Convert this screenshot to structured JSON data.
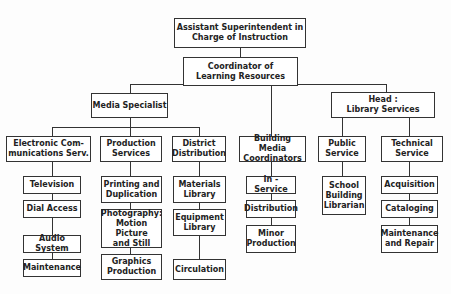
{
  "chart": {
    "root": "Assistant Superintendent in\nCharge of Instruction",
    "coordinator": "Coordinator of\nLearning Resources",
    "media_specialist": "Media Specialist",
    "head_library": "Head :\nLibrary Services",
    "electronic": "Electronic Com-\nmunications Serv.",
    "production": "Production\nServices",
    "district": "District\nDistribution",
    "building": "Building Media\nCoordinators",
    "public": "Public\nService",
    "technical": "Technical\nService",
    "electronic_items": [
      "Television",
      "Dial Access",
      "Audio System",
      "Maintenance"
    ],
    "production_items": [
      "Printing and\nDuplication",
      "Photography:\nMotion Picture\nand Still",
      "Graphics\nProduction"
    ],
    "district_items": [
      "Materials\nLibrary",
      "Equipment\nLibrary",
      "Circulation"
    ],
    "building_items": [
      "In - Service",
      "Distribution",
      "Minor\nProduction"
    ],
    "public_items": [
      "School\nBuilding\nLibrarian"
    ],
    "technical_items": [
      "Acquisition",
      "Cataloging",
      "Maintenance\nand Repair"
    ]
  }
}
